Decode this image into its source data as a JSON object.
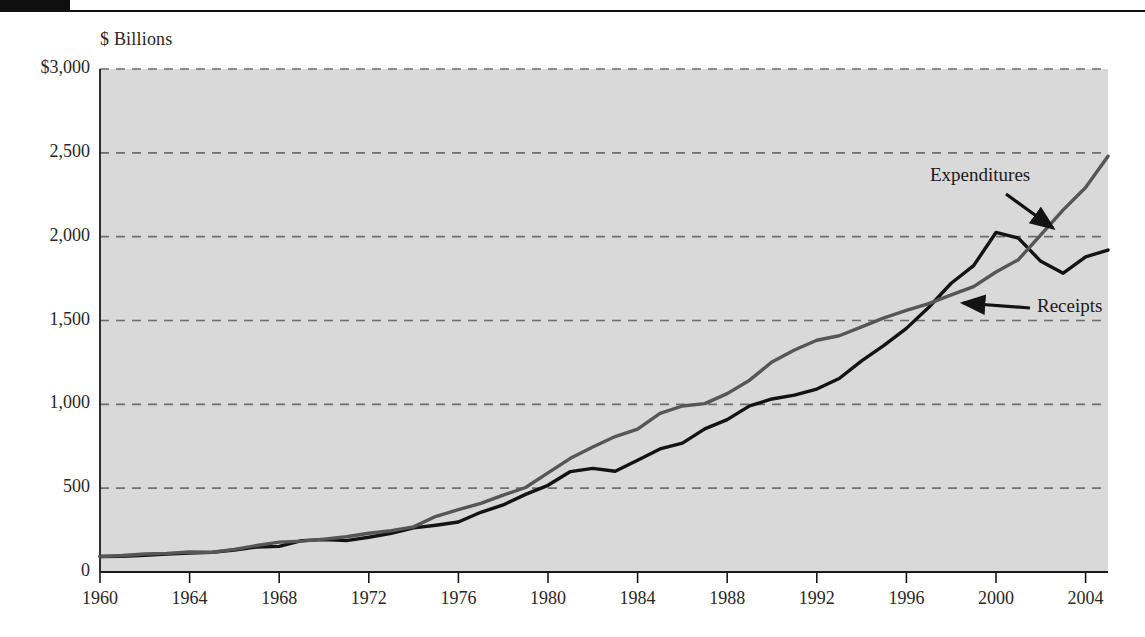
{
  "figure": {
    "decoration": {
      "tab_label": "",
      "rule": "horizontal-rule"
    }
  },
  "chart_data": {
    "type": "line",
    "title": "",
    "subtitle": "",
    "xlabel": "",
    "ylabel": "$ Billions",
    "unit_label": "$ Billions",
    "xlim": [
      1960,
      2005
    ],
    "ylim": [
      0,
      3000
    ],
    "grid": "horizontal-dashed",
    "legend_position": "inline-annotations",
    "xtick_labels": [
      "1960",
      "1964",
      "1968",
      "1972",
      "1976",
      "1980",
      "1984",
      "1988",
      "1992",
      "1996",
      "2000",
      "2004"
    ],
    "xticks": [
      1960,
      1964,
      1968,
      1972,
      1976,
      1980,
      1984,
      1988,
      1992,
      1996,
      2000,
      2004
    ],
    "ytick_labels": [
      "$3,000",
      "2,500",
      "2,000",
      "1,500",
      "1,000",
      "500",
      "0"
    ],
    "yticks": [
      3000,
      2500,
      2000,
      1500,
      1000,
      500,
      0
    ],
    "annotations": [
      {
        "text": "Expenditures",
        "series": "Expenditures",
        "arrow": "down-right"
      },
      {
        "text": "Receipts",
        "series": "Receipts",
        "arrow": "left"
      }
    ],
    "colors": {
      "expenditures": "#565656",
      "receipts": "#131313",
      "plot_background": "#d9d9d9",
      "gridline": "#6e6e6e",
      "axis": "#1a1a1a"
    },
    "x": [
      1960,
      1961,
      1962,
      1963,
      1964,
      1965,
      1966,
      1967,
      1968,
      1969,
      1970,
      1971,
      1972,
      1973,
      1974,
      1975,
      1976,
      1977,
      1978,
      1979,
      1980,
      1981,
      1982,
      1983,
      1984,
      1985,
      1986,
      1987,
      1988,
      1989,
      1990,
      1991,
      1992,
      1993,
      1994,
      1995,
      1996,
      1997,
      1998,
      1999,
      2000,
      2001,
      2002,
      2003,
      2004,
      2005
    ],
    "series": [
      {
        "name": "Receipts",
        "color": "#131313",
        "values": [
          92,
          94,
          100,
          107,
          113,
          117,
          131,
          149,
          153,
          187,
          193,
          187,
          207,
          231,
          263,
          279,
          298,
          356,
          400,
          463,
          517,
          599,
          618,
          601,
          666,
          734,
          769,
          854,
          909,
          991,
          1032,
          1055,
          1091,
          1154,
          1259,
          1352,
          1453,
          1579,
          1722,
          1827,
          2025,
          1991,
          1853,
          1782,
          1880,
          1920
        ]
      },
      {
        "name": "Expenditures",
        "color": "#565656",
        "values": [
          92,
          98,
          107,
          111,
          119,
          118,
          135,
          158,
          178,
          184,
          196,
          210,
          231,
          246,
          269,
          332,
          372,
          409,
          459,
          504,
          591,
          678,
          746,
          808,
          852,
          946,
          990,
          1004,
          1064,
          1144,
          1253,
          1324,
          1382,
          1409,
          1462,
          1516,
          1561,
          1601,
          1653,
          1702,
          1789,
          1863,
          2011,
          2160,
          2293,
          2480
        ]
      }
    ]
  }
}
